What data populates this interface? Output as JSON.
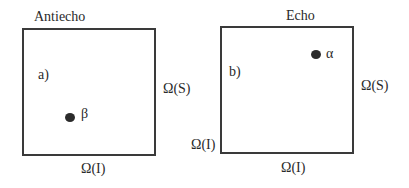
{
  "panels": [
    {
      "title": "Antiecho",
      "tag": "a)",
      "point_label": "β",
      "right_label": "Ω(S)",
      "bottom_label": "Ω(I)"
    },
    {
      "title": "Echo",
      "tag": "b)",
      "point_label": "α",
      "right_label": "Ω(S)",
      "bottom_label": "Ω(I)",
      "corner_label": "Ω(I)"
    }
  ]
}
